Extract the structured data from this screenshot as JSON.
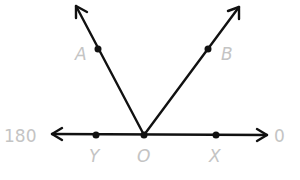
{
  "diagram": {
    "type": "angles-on-a-line",
    "vertex": {
      "label": "O",
      "x": 144,
      "y": 135
    },
    "line": {
      "left_end_label": "180",
      "right_end_label": "0"
    },
    "rays": [
      {
        "name": "OA",
        "point_label": "A"
      },
      {
        "name": "OB",
        "point_label": "B"
      },
      {
        "name": "OY",
        "point_label": "Y"
      },
      {
        "name": "OX",
        "point_label": "X"
      }
    ],
    "colors": {
      "line": "#111111",
      "label": "#c4c4c4"
    }
  }
}
